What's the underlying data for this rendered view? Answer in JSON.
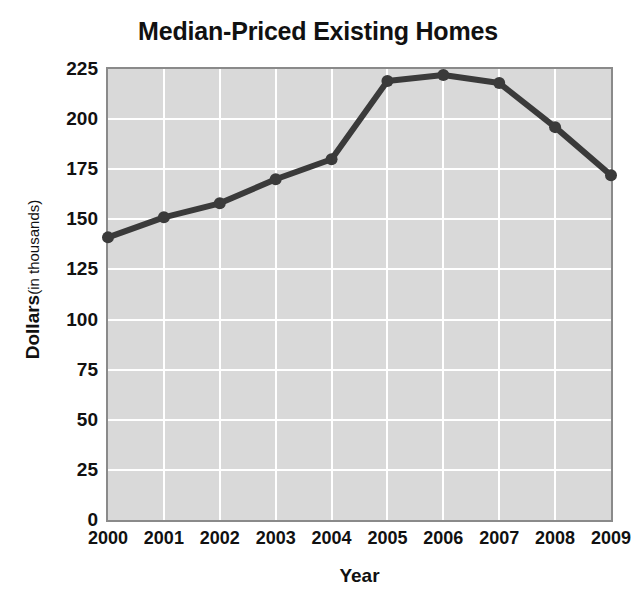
{
  "chart_data": {
    "type": "line",
    "title": "Median-Priced Existing Homes",
    "xlabel": "Year",
    "ylabel": "Dollars",
    "ylabel_suffix": "(in thousands)",
    "categories": [
      "2000",
      "2001",
      "2002",
      "2003",
      "2004",
      "2005",
      "2006",
      "2007",
      "2008",
      "2009"
    ],
    "values": [
      141,
      151,
      158,
      170,
      180,
      219,
      222,
      218,
      196,
      172
    ],
    "series": [
      {
        "name": "Median price",
        "values": [
          141,
          151,
          158,
          170,
          180,
          219,
          222,
          218,
          196,
          172
        ]
      }
    ],
    "x": [
      2000,
      2001,
      2002,
      2003,
      2004,
      2005,
      2006,
      2007,
      2008,
      2009
    ],
    "ylim": [
      0,
      225
    ],
    "yticks": [
      "225",
      "200",
      "175",
      "150",
      "125",
      "100",
      "75",
      "50",
      "25",
      "0"
    ],
    "ytick_values": [
      225,
      200,
      175,
      150,
      125,
      100,
      75,
      50,
      25,
      0
    ],
    "xtick_labels": [
      "2000",
      "2001",
      "2002",
      "2003",
      "2004",
      "2005",
      "2006",
      "2007",
      "2008",
      "2009"
    ],
    "grid": true,
    "legend": false,
    "colors": {
      "plot_background": "#d9d9d9",
      "gridline": "#ffffff",
      "plot_border": "#8a8a8a",
      "line": "#3a3a3a",
      "marker": "#3a3a3a",
      "text": "#111111",
      "page_background": "#ffffff"
    }
  }
}
